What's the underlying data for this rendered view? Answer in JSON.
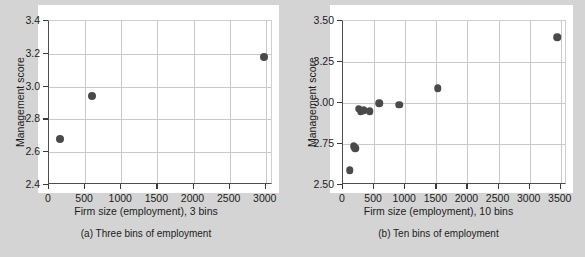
{
  "figure": {
    "background_color": "#d4d4d4",
    "panel_color": "#ffffff",
    "marker_color": "#4a4a4a",
    "grid_color": "#c9c9c9",
    "axis_color": "#3a3a3a"
  },
  "chart_data": [
    {
      "type": "scatter",
      "panel_label": "(a)",
      "caption": "(a) Three bins of employment",
      "title": "",
      "xlabel": "Firm size (employment), 3 bins",
      "ylabel": "Management score",
      "xlim": [
        0,
        3100
      ],
      "ylim": [
        2.4,
        3.4
      ],
      "xticks": [
        0,
        500,
        1000,
        1500,
        2000,
        2500,
        3000
      ],
      "xticklabels": [
        "0",
        "500",
        "1000",
        "1500",
        "2000",
        "2500",
        "3000"
      ],
      "yticks": [
        2.4,
        2.6,
        2.8,
        3.0,
        3.2,
        3.4
      ],
      "yticklabels": [
        "2.4",
        "2.6",
        "2.8",
        "3.0",
        "3.2",
        "3.4"
      ],
      "grid": true,
      "legend": "none",
      "x": [
        150,
        600,
        2975
      ],
      "y": [
        2.68,
        2.94,
        3.18
      ],
      "points": [
        {
          "x": 150,
          "y": 2.68
        },
        {
          "x": 600,
          "y": 2.94
        },
        {
          "x": 2975,
          "y": 3.18
        }
      ]
    },
    {
      "type": "scatter",
      "panel_label": "(b)",
      "caption": "(b) Ten bins of employment",
      "title": "",
      "xlabel": "Firm size (employment), 10 bins",
      "ylabel": "Management score",
      "xlim": [
        0,
        3600
      ],
      "ylim": [
        2.5,
        3.5
      ],
      "xticks": [
        0,
        500,
        1000,
        1500,
        2000,
        2500,
        3000,
        3500
      ],
      "xticklabels": [
        "0",
        "500",
        "1000",
        "1500",
        "2000",
        "2500",
        "3000",
        "3500"
      ],
      "yticks": [
        2.5,
        2.75,
        3.0,
        3.25,
        3.5
      ],
      "yticklabels": [
        "2.50",
        "2.75",
        "3.00",
        "3.25",
        "3.50"
      ],
      "grid": true,
      "legend": "none",
      "x": [
        110,
        175,
        195,
        250,
        285,
        330,
        430,
        580,
        900,
        1520,
        3440
      ],
      "y": [
        2.59,
        2.735,
        2.725,
        2.965,
        2.95,
        2.955,
        2.95,
        3.0,
        2.99,
        3.09,
        3.4
      ],
      "points": [
        {
          "x": 110,
          "y": 2.59
        },
        {
          "x": 175,
          "y": 2.735
        },
        {
          "x": 195,
          "y": 2.725
        },
        {
          "x": 250,
          "y": 2.965
        },
        {
          "x": 285,
          "y": 2.95
        },
        {
          "x": 330,
          "y": 2.955
        },
        {
          "x": 430,
          "y": 2.95
        },
        {
          "x": 580,
          "y": 3.0
        },
        {
          "x": 900,
          "y": 2.99
        },
        {
          "x": 1520,
          "y": 3.09
        },
        {
          "x": 3440,
          "y": 3.4
        }
      ]
    }
  ]
}
